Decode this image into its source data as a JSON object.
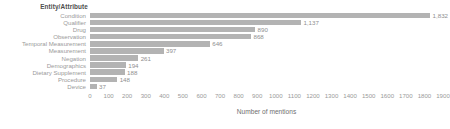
{
  "chart_data": {
    "type": "bar",
    "orientation": "horizontal",
    "title": "",
    "group_title": "Entity/Attribute",
    "xlabel": "Number of mentions",
    "ylabel": "Entity/Attribute",
    "xlim": [
      0,
      1900
    ],
    "xticks": [
      0,
      100,
      200,
      300,
      400,
      500,
      600,
      700,
      800,
      900,
      1000,
      1100,
      1200,
      1300,
      1400,
      1500,
      1600,
      1700,
      1800,
      1900
    ],
    "xtick_labels": [
      "0",
      "100",
      "200",
      "300",
      "400",
      "500",
      "600",
      "700",
      "800",
      "900",
      "1000",
      "1100",
      "1200",
      "1300",
      "1400",
      "1500",
      "1600",
      "1700",
      "1800",
      "1900"
    ],
    "grid": false,
    "bar_color": "#b3b3b3",
    "categories": [
      "Condition",
      "Qualifier",
      "Drug",
      "Observation",
      "Temporal Measurement",
      "Measurement",
      "Negation",
      "Demographics",
      "Dietary Supplement",
      "Procedure",
      "Device"
    ],
    "values": [
      1832,
      1137,
      890,
      868,
      646,
      397,
      261,
      194,
      188,
      148,
      37
    ],
    "value_labels": [
      "1,832",
      "1,137",
      "890",
      "868",
      "646",
      "397",
      "261",
      "194",
      "188",
      "148",
      "37"
    ]
  }
}
